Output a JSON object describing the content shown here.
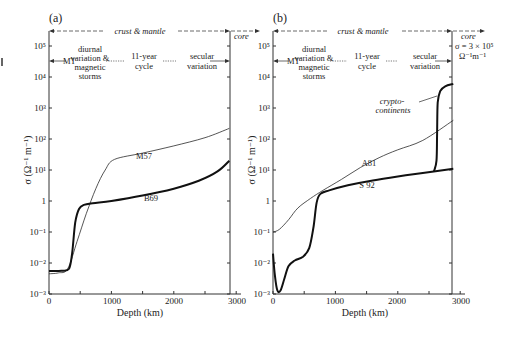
{
  "chart_data": [
    {
      "panel_label": "(a)",
      "type": "line",
      "xlabel": "Depth (km)",
      "ylabel": "σ (Ω⁻¹ m⁻¹)",
      "x_ticks": [
        0,
        1000,
        2000,
        3000
      ],
      "y_ticks": [
        "10⁻³",
        "10⁻²",
        "10⁻¹",
        "1",
        "10¹",
        "10²",
        "10³",
        "10⁴",
        "10⁵"
      ],
      "y_scale": "log",
      "xlim": [
        0,
        3000
      ],
      "ylim": [
        0.001,
        100000
      ],
      "core_boundary_km": 2890,
      "annotations": {
        "crust_mantle": "crust & mantle",
        "core": "core",
        "mt": "MT",
        "diurnal": [
          "diurnal",
          "variation &",
          "magnetic",
          "storms"
        ],
        "eleven_year": [
          "11-year",
          "cycle"
        ],
        "secular": [
          "secular",
          "variation"
        ]
      },
      "series": [
        {
          "name": "M57",
          "style": "thin",
          "points": [
            [
              0,
              0.0045
            ],
            [
              150,
              0.0048
            ],
            [
              300,
              0.0065
            ],
            [
              450,
              0.05
            ],
            [
              600,
              0.4
            ],
            [
              750,
              2.5
            ],
            [
              900,
              10
            ],
            [
              1050,
              22
            ],
            [
              1500,
              35
            ],
            [
              2000,
              60
            ],
            [
              2500,
              110
            ],
            [
              2890,
              220
            ]
          ]
        },
        {
          "name": "B69",
          "style": "thick",
          "points": [
            [
              0,
              0.0055
            ],
            [
              200,
              0.0056
            ],
            [
              320,
              0.0065
            ],
            [
              370,
              0.02
            ],
            [
              420,
              0.2
            ],
            [
              480,
              0.55
            ],
            [
              560,
              0.75
            ],
            [
              700,
              0.85
            ],
            [
              1000,
              1.0
            ],
            [
              1500,
              1.5
            ],
            [
              2000,
              2.5
            ],
            [
              2400,
              4.5
            ],
            [
              2700,
              9
            ],
            [
              2890,
              20
            ]
          ]
        }
      ]
    },
    {
      "panel_label": "(b)",
      "type": "line",
      "xlabel": "Depth (km)",
      "ylabel": "σ (Ω⁻¹ m⁻¹)",
      "x_ticks": [
        0,
        1000,
        2000,
        3000
      ],
      "y_ticks": [
        "10⁻³",
        "10⁻²",
        "10⁻¹",
        "1",
        "10¹",
        "10²",
        "10³",
        "10⁴",
        "10⁵"
      ],
      "y_scale": "log",
      "xlim": [
        0,
        3000
      ],
      "ylim": [
        0.001,
        100000
      ],
      "core_boundary_km": 2890,
      "annotations": {
        "crust_mantle": "crust & mantle",
        "core": "core",
        "core_sigma_line1": "σ = 3 × 10⁵",
        "core_sigma_line2": "Ω⁻¹m⁻¹",
        "mt": "MT",
        "diurnal": [
          "diurnal",
          "variation &",
          "magnetic",
          "storms"
        ],
        "eleven_year": [
          "11-year",
          "cycle"
        ],
        "secular": [
          "secular",
          "variation"
        ],
        "crypto": [
          "crypto-",
          "continents"
        ]
      },
      "series": [
        {
          "name": "A81",
          "style": "thin",
          "points": [
            [
              0,
              0.1
            ],
            [
              100,
              0.12
            ],
            [
              250,
              0.25
            ],
            [
              400,
              0.6
            ],
            [
              600,
              1.2
            ],
            [
              800,
              2.2
            ],
            [
              1100,
              5
            ],
            [
              1400,
              12
            ],
            [
              1700,
              25
            ],
            [
              2000,
              45
            ],
            [
              2400,
              90
            ],
            [
              2890,
              400
            ]
          ]
        },
        {
          "name": "S 92",
          "style": "thick",
          "points": [
            [
              0,
              0.02
            ],
            [
              30,
              0.004
            ],
            [
              70,
              0.0013
            ],
            [
              120,
              0.0013
            ],
            [
              180,
              0.003
            ],
            [
              250,
              0.008
            ],
            [
              350,
              0.012
            ],
            [
              480,
              0.016
            ],
            [
              580,
              0.03
            ],
            [
              650,
              0.15
            ],
            [
              700,
              0.9
            ],
            [
              760,
              1.7
            ],
            [
              900,
              2.2
            ],
            [
              1200,
              3.2
            ],
            [
              1600,
              4.6
            ],
            [
              2000,
              6.2
            ],
            [
              2400,
              8
            ],
            [
              2890,
              11
            ]
          ]
        },
        {
          "name": "crypto-continents",
          "style": "thick",
          "points": [
            [
              2580,
              9
            ],
            [
              2620,
              20
            ],
            [
              2630,
              150
            ],
            [
              2640,
              1500
            ],
            [
              2680,
              3500
            ],
            [
              2760,
              5000
            ],
            [
              2890,
              6000
            ]
          ]
        }
      ]
    }
  ],
  "labels": {
    "panel_a": "(a)",
    "panel_b": "(b)",
    "crust_mantle": "crust & mantle",
    "core": "core",
    "mt": "MT",
    "d1": "diurnal",
    "d2": "variation &",
    "d3": "magnetic",
    "d4": "storms",
    "c1": "11-year",
    "c2": "cycle",
    "s1": "secular",
    "s2": "variation",
    "sigma_core_1": "σ = 3 × 10⁵",
    "sigma_core_2": "Ω⁻¹m⁻¹",
    "crypto_1": "crypto-",
    "crypto_2": "continents",
    "M57": "M57",
    "B69": "B69",
    "A81": "A81",
    "S92": "S 92",
    "xlabel": "Depth (km)",
    "ylabel": "σ (Ω⁻¹ m⁻¹)",
    "x0": "0",
    "x1000": "1000",
    "x2000": "2000",
    "x3000": "3000",
    "y_base": "10",
    "y_one": "1"
  }
}
